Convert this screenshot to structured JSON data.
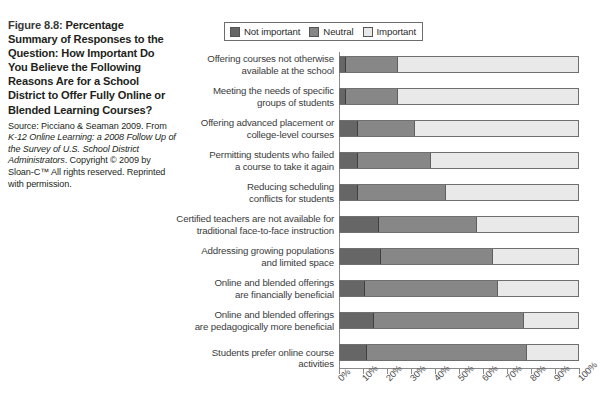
{
  "caption": {
    "figure_number": "Figure 8.8:",
    "headline": " Percentage Summary of Responses to the Question: How Important Do You Believe the Following Reasons Are for a School District to Offer Fully Online or Blended Learning Courses?",
    "source_prefix": "Source: Picciano & Seaman 2009. From ",
    "source_italic": "K-12 Online Learning: a 2008 Follow Up of the Survey of U.S. School District Administrators",
    "source_suffix": ". Copyright © 2009 by Sloan-C™ All rights reserved. Reprinted with permission."
  },
  "legend": {
    "items": [
      {
        "label": "Not important",
        "color": "#666666",
        "icon": "legend-swatch-not-important"
      },
      {
        "label": "Neutral",
        "color": "#878787",
        "icon": "legend-swatch-neutral"
      },
      {
        "label": "Important",
        "color": "#e9e9e9",
        "icon": "legend-swatch-important"
      }
    ]
  },
  "chart_data": {
    "type": "bar",
    "orientation": "horizontal",
    "stacked": true,
    "title": "Percentage Summary of Responses to the Question: How Important Do You Believe the Following Reasons Are for a School District to Offer Fully Online or Blended Learning Courses?",
    "xlabel": "",
    "ylabel": "",
    "xlim": [
      0,
      100
    ],
    "grid": false,
    "legend_position": "top-right",
    "xticks": [
      "0%",
      "10%",
      "20%",
      "30%",
      "40%",
      "50%",
      "60%",
      "70%",
      "80%",
      "90%",
      "100%"
    ],
    "xtick_values": [
      0,
      10,
      20,
      30,
      40,
      50,
      60,
      70,
      80,
      90,
      100
    ],
    "categories": [
      "Offering courses not otherwise available at the school",
      "Meeting the needs of specific groups of students",
      "Offering advanced placement or college-level courses",
      "Permitting students who failed a course to take it again",
      "Reducing scheduling conflicts for students",
      "Certified teachers are not available for traditional face-to-face instruction",
      "Addressing growing populations and limited space",
      "Online and blended offerings are financially beneficial",
      "Online and blended offerings are pedagogically more beneficial",
      "Students prefer online course activities"
    ],
    "category_lines": [
      [
        "Offering courses not otherwise",
        "available at the school"
      ],
      [
        "Meeting the needs of specific",
        "groups of students"
      ],
      [
        "Offering advanced placement or",
        "college-level courses"
      ],
      [
        "Permitting students who failed",
        "a course to take it again"
      ],
      [
        "Reducing scheduling",
        "conflicts for students"
      ],
      [
        "Certified teachers are not available for",
        "traditional face-to-face instruction"
      ],
      [
        "Addressing growing populations",
        "and limited space"
      ],
      [
        "Online and blended offerings",
        "are financially beneficial"
      ],
      [
        "Online and blended offerings",
        "are pedagogically more beneficial"
      ],
      [
        "Students prefer online course activities"
      ]
    ],
    "series": [
      {
        "name": "Not important",
        "color": "#666666",
        "values": [
          2,
          2,
          7,
          7,
          7,
          16,
          17,
          10,
          14,
          11
        ]
      },
      {
        "name": "Neutral",
        "color": "#878787",
        "values": [
          22,
          22,
          24,
          31,
          37,
          41,
          47,
          56,
          63,
          67
        ]
      },
      {
        "name": "Important",
        "color": "#e9e9e9",
        "values": [
          76,
          76,
          69,
          62,
          56,
          43,
          36,
          34,
          23,
          22
        ]
      }
    ]
  }
}
